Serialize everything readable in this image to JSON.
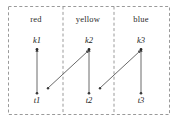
{
  "figure": {
    "title": "",
    "columns": [
      {
        "label": "red",
        "x_center": 36,
        "divider_x": 63
      },
      {
        "label": "yellow",
        "x_center": 88,
        "divider_x": 114
      },
      {
        "label": "blue",
        "x_center": 141,
        "divider_x": null
      }
    ],
    "nodes": {
      "top": [
        {
          "id": "k1",
          "label": "k1",
          "x": 37,
          "y": 47
        },
        {
          "id": "k2",
          "label": "k2",
          "x": 89,
          "y": 47
        },
        {
          "id": "k3",
          "label": "k3",
          "x": 141,
          "y": 47
        }
      ],
      "bottom": [
        {
          "id": "t1",
          "label": "t1",
          "x": 37,
          "y": 95
        },
        {
          "id": "t2",
          "label": "t2",
          "x": 89,
          "y": 95
        },
        {
          "id": "t3",
          "label": "t3",
          "x": 141,
          "y": 95
        }
      ]
    },
    "arrows": [
      {
        "id": "t1-k1",
        "from": "t1",
        "to": "k1",
        "kind": "vertical"
      },
      {
        "id": "t2-k2",
        "from": "t2",
        "to": "k2",
        "kind": "vertical"
      },
      {
        "id": "t3-k3",
        "from": "t3",
        "to": "k3",
        "kind": "vertical"
      },
      {
        "id": "t1-k2",
        "from": "t1",
        "to": "k2",
        "kind": "diagonal"
      },
      {
        "id": "t2-k3",
        "from": "t2",
        "to": "k3",
        "kind": "diagonal"
      }
    ],
    "border": {
      "style": "dashed",
      "x": 8,
      "y": 6,
      "width": 162,
      "height": 109
    },
    "colors": {
      "line": "#595959",
      "dash": "#8c8c8c",
      "text": "#1a1a1a",
      "background": "#ffffff"
    }
  }
}
